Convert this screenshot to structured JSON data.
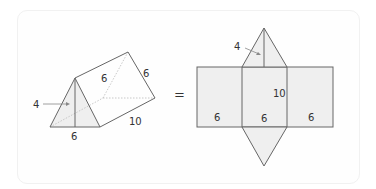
{
  "diagram": {
    "equals_sign": "=",
    "prism": {
      "labels": {
        "height": "4",
        "base": "6",
        "side_top": "6",
        "side_back": "6",
        "length": "10"
      }
    },
    "net": {
      "labels": {
        "triangle_height": "4",
        "length": "10",
        "left_face_width": "6",
        "middle_face_width": "6",
        "right_face_width": "6"
      }
    },
    "colors": {
      "stroke": "#6a6a6a",
      "fill": "#eeeeee",
      "dashed": "#aaaaaa",
      "text": "#333333"
    }
  }
}
